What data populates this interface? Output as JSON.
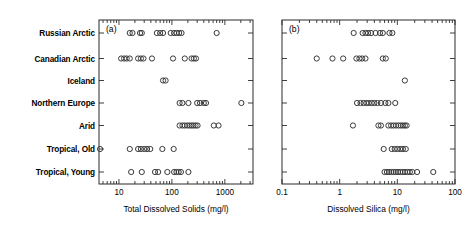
{
  "figure": {
    "width": 475,
    "height": 233,
    "background": "#ffffff",
    "marker_color": "#3a3a3a",
    "axis_color": "#2b2b2b"
  },
  "categories": [
    "Russian Arctic",
    "Canadian Arctic",
    "Iceland",
    "Northern Europe",
    "Arid",
    "Tropical, Old",
    "Tropical, Young"
  ],
  "chart_data": [
    {
      "type": "scatter",
      "panel_tag": "(a)",
      "title": "",
      "xlabel": "Total Dissolved Solids (mg/l)",
      "ylabel": "",
      "xscale": "log",
      "xlim": [
        4.2,
        3400
      ],
      "xticks": [
        10,
        100,
        1000
      ],
      "xticklabels": [
        "10",
        "100",
        "1000"
      ],
      "grid": false,
      "legend": "none",
      "categories": [
        "Russian Arctic",
        "Canadian Arctic",
        "Iceland",
        "Northern Europe",
        "Arid",
        "Tropical, Old",
        "Tropical, Young"
      ],
      "series": [
        {
          "name": "Russian Arctic",
          "values": [
            16,
            18,
            25,
            27,
            52,
            60,
            68,
            95,
            110,
            123,
            137,
            152,
            700
          ]
        },
        {
          "name": "Canadian Arctic",
          "values": [
            11,
            12.5,
            14,
            16,
            23,
            26,
            29,
            42,
            105,
            175,
            235,
            260,
            285
          ]
        },
        {
          "name": "Iceland",
          "values": [
            68,
            76
          ]
        },
        {
          "name": "Northern Europe",
          "values": [
            140,
            158,
            205,
            300,
            340,
            400,
            440,
            2050
          ]
        },
        {
          "name": "Arid",
          "values": [
            140,
            158,
            175,
            195,
            215,
            235,
            255,
            280,
            305,
            620,
            760
          ]
        },
        {
          "name": "Tropical, Old",
          "values": [
            4.4,
            16,
            23,
            26,
            30,
            34,
            39,
            66,
            108
          ]
        },
        {
          "name": "Tropical, Young",
          "values": [
            17,
            27,
            48,
            55,
            82,
            110,
            122,
            134,
            148,
            205
          ]
        }
      ]
    },
    {
      "type": "scatter",
      "panel_tag": "(b)",
      "title": "",
      "xlabel": "Dissolved Silica (mg/l)",
      "ylabel": "",
      "xscale": "log",
      "xlim": [
        0.1,
        100
      ],
      "xticks": [
        0.1,
        1,
        10,
        100
      ],
      "xticklabels": [
        "0.1",
        "1",
        "10",
        "100"
      ],
      "grid": false,
      "legend": "none",
      "categories": [
        "Russian Arctic",
        "Canadian Arctic",
        "Iceland",
        "Northern Europe",
        "Arid",
        "Tropical, Old",
        "Tropical, Young"
      ],
      "series": [
        {
          "name": "Russian Arctic",
          "values": [
            1.75,
            2.5,
            2.8,
            3.1,
            3.5,
            4.2,
            5.0,
            5.6,
            7.3,
            8.2
          ]
        },
        {
          "name": "Canadian Arctic",
          "values": [
            0.4,
            0.75,
            1.15,
            1.95,
            2.2,
            2.45,
            2.8,
            5.6,
            6.3
          ]
        },
        {
          "name": "Iceland",
          "values": [
            13.5
          ]
        },
        {
          "name": "Northern Europe",
          "values": [
            2.0,
            2.3,
            2.6,
            2.9,
            3.2,
            3.6,
            4.0,
            4.5,
            5.2,
            6.2,
            7.0,
            9.2
          ]
        },
        {
          "name": "Arid",
          "values": [
            1.7,
            4.7,
            5.2,
            7.0,
            7.8,
            8.6,
            9.5,
            10.5,
            11.5,
            12.5,
            13.5,
            14.5
          ]
        },
        {
          "name": "Tropical, Old",
          "values": [
            5.8,
            8.0,
            9.0,
            10.0,
            11.2,
            12.5,
            14.0
          ]
        },
        {
          "name": "Tropical, Young",
          "values": [
            6.0,
            6.6,
            7.2,
            7.9,
            8.6,
            9.4,
            10.3,
            11.3,
            12.4,
            13.6,
            15.0,
            16.5,
            18.2,
            22.0,
            42.0
          ]
        }
      ]
    }
  ]
}
